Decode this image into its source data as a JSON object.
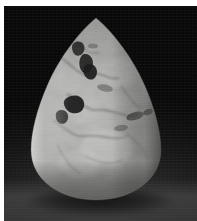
{
  "image": {
    "type": "photograph",
    "subject_name": "pear-shaped-cabochon-stone",
    "description": "Grayscale studio photograph of a polished teardrop (pear) shaped stone cabochon with mottled surface and dark inclusions, resting on a dark background",
    "color_mode": "grayscale",
    "width_px": 197,
    "height_px": 221,
    "border": {
      "name": "white-photo-margin",
      "color": "#ffffff",
      "left_px": 4,
      "top_px": 6,
      "right_px": 0,
      "bottom_px": 0
    },
    "background": {
      "name": "dark-studio-backdrop",
      "top_color": "#060606",
      "mid_color": "#1a1a1a",
      "bottom_color": "#3a3a3a",
      "has_floor_gradient": true
    },
    "subject": {
      "shape": "teardrop",
      "left_px": 29,
      "top_px": 16,
      "width_px": 134,
      "height_px": 186,
      "base_color": "#a9a9a7",
      "highlight_color": "#d2d2d0",
      "shadow_color": "#6f6f6d",
      "inclusion_color": "#1c1c1c",
      "rim_highlight": "left-edge",
      "surface": "mottled-matte-polished",
      "inclusions": [
        {
          "name": "inclusion-upper-left",
          "cx": 42,
          "cy": 31,
          "rx": 7,
          "ry": 5
        },
        {
          "name": "inclusion-upper-center",
          "cx": 54,
          "cy": 44,
          "rx": 6,
          "ry": 9
        },
        {
          "name": "inclusion-dark-blob-upper",
          "cx": 60,
          "cy": 52,
          "rx": 5,
          "ry": 6
        },
        {
          "name": "inclusion-mid-left-dark",
          "cx": 46,
          "cy": 86,
          "rx": 9,
          "ry": 7
        },
        {
          "name": "inclusion-left-low",
          "cx": 36,
          "cy": 99,
          "rx": 6,
          "ry": 5
        },
        {
          "name": "inclusion-right-streak",
          "cx": 106,
          "cy": 100,
          "rx": 10,
          "ry": 5
        },
        {
          "name": "inclusion-far-right",
          "cx": 121,
          "cy": 96,
          "rx": 6,
          "ry": 4
        },
        {
          "name": "inclusion-center-faint",
          "cx": 76,
          "cy": 74,
          "rx": 8,
          "ry": 4
        }
      ]
    },
    "cast_shadow": {
      "name": "stone-cast-shadow",
      "color": "#000000",
      "opacity": 0.7
    }
  }
}
